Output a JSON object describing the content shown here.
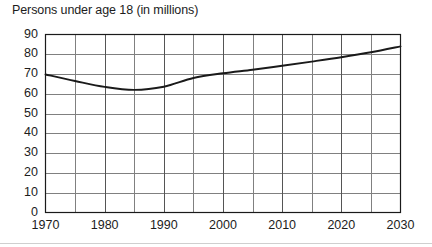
{
  "chart_data": {
    "type": "line",
    "title": "Persons under age 18 (in millions)",
    "xlabel": "",
    "ylabel": "",
    "xlim": [
      1970,
      2030
    ],
    "ylim": [
      0,
      90
    ],
    "grid": true,
    "legend": "none",
    "x_ticks": [
      1970,
      1980,
      1990,
      2000,
      2010,
      2020,
      2030
    ],
    "y_ticks": [
      0,
      10,
      20,
      30,
      40,
      50,
      60,
      70,
      80,
      90
    ],
    "x_gridline_step": 5,
    "y_gridline_step": 10,
    "series": [
      {
        "name": "Persons under age 18",
        "x": [
          1970,
          1975,
          1980,
          1985,
          1990,
          1995,
          2000,
          2005,
          2010,
          2015,
          2020,
          2025,
          2030
        ],
        "values": [
          69.8,
          66.5,
          63.5,
          62.0,
          63.6,
          68.0,
          70.4,
          72.2,
          74.2,
          76.3,
          78.5,
          81.0,
          84.0
        ]
      }
    ]
  },
  "axes": {
    "y_tick_labels": [
      "90",
      "80",
      "70",
      "60",
      "50",
      "40",
      "30",
      "20",
      "10",
      "0"
    ],
    "x_tick_labels": [
      "1970",
      "1980",
      "1990",
      "2000",
      "2010",
      "2020",
      "2030"
    ]
  },
  "colors": {
    "line": "#1a1a1a",
    "grid": "#808080",
    "frame": "#1a1a1a",
    "background": "#ffffff",
    "text": "#1c1c1c"
  }
}
